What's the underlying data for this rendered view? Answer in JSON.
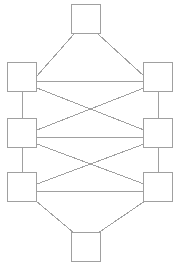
{
  "diagram": {
    "type": "node-link-diagram",
    "canvas": {
      "width": 181,
      "height": 269,
      "background": "#ffffff"
    },
    "style": {
      "node_shape": "square",
      "node_fill": "#ffffff",
      "node_stroke": "#a0a0a0",
      "node_stroke_width": 1,
      "node_size": 29,
      "edge_stroke": "#a0a0a0",
      "edge_stroke_width": 1
    },
    "nodes": [
      {
        "id": "top",
        "label": "",
        "x": 86,
        "y": 19,
        "w": 29,
        "h": 29,
        "row": 0,
        "column": "center"
      },
      {
        "id": "row1-left",
        "label": "",
        "x": 22,
        "y": 77,
        "w": 29,
        "h": 29,
        "row": 1,
        "column": "left"
      },
      {
        "id": "row1-right",
        "label": "",
        "x": 158,
        "y": 77,
        "w": 29,
        "h": 29,
        "row": 1,
        "column": "right"
      },
      {
        "id": "row2-left",
        "label": "",
        "x": 22,
        "y": 133,
        "w": 29,
        "h": 29,
        "row": 2,
        "column": "left"
      },
      {
        "id": "row2-right",
        "label": "",
        "x": 158,
        "y": 133,
        "w": 29,
        "h": 29,
        "row": 2,
        "column": "right"
      },
      {
        "id": "row3-left",
        "label": "",
        "x": 22,
        "y": 187,
        "w": 29,
        "h": 29,
        "row": 3,
        "column": "left"
      },
      {
        "id": "row3-right",
        "label": "",
        "x": 158,
        "y": 187,
        "w": 29,
        "h": 29,
        "row": 3,
        "column": "right"
      },
      {
        "id": "bottom",
        "label": "",
        "x": 86,
        "y": 247,
        "w": 29,
        "h": 29,
        "row": 4,
        "column": "center"
      }
    ],
    "edges": [
      {
        "id": "e-top-r1l",
        "from": "top",
        "to": "row1-left",
        "kind": "diagonal",
        "x1": 74,
        "y1": 34,
        "x2": 36,
        "y2": 77
      },
      {
        "id": "e-top-r1r",
        "from": "top",
        "to": "row1-right",
        "kind": "diagonal",
        "x1": 98,
        "y1": 34,
        "x2": 145,
        "y2": 77
      },
      {
        "id": "e-r1-rung",
        "from": "row1-left",
        "to": "row1-right",
        "kind": "horizontal",
        "x1": 37,
        "y1": 81,
        "x2": 144,
        "y2": 81
      },
      {
        "id": "e-r2-rung",
        "from": "row2-left",
        "to": "row2-right",
        "kind": "horizontal",
        "x1": 37,
        "y1": 137,
        "x2": 144,
        "y2": 137
      },
      {
        "id": "e-r3-rung",
        "from": "row3-left",
        "to": "row3-right",
        "kind": "horizontal",
        "x1": 37,
        "y1": 191,
        "x2": 144,
        "y2": 191
      },
      {
        "id": "e-left-1-2",
        "from": "row1-left",
        "to": "row2-left",
        "kind": "vertical",
        "x1": 22,
        "y1": 92,
        "x2": 22,
        "y2": 118
      },
      {
        "id": "e-left-2-3",
        "from": "row2-left",
        "to": "row3-left",
        "kind": "vertical",
        "x1": 22,
        "y1": 148,
        "x2": 22,
        "y2": 172
      },
      {
        "id": "e-right-1-2",
        "from": "row1-right",
        "to": "row2-right",
        "kind": "vertical",
        "x1": 158,
        "y1": 92,
        "x2": 158,
        "y2": 118
      },
      {
        "id": "e-right-2-3",
        "from": "row2-right",
        "to": "row3-right",
        "kind": "vertical",
        "x1": 158,
        "y1": 148,
        "x2": 158,
        "y2": 172
      },
      {
        "id": "e-x1-a",
        "from": "row1-left",
        "to": "row2-right",
        "kind": "cross",
        "x1": 37,
        "y1": 88,
        "x2": 144,
        "y2": 130
      },
      {
        "id": "e-x1-b",
        "from": "row1-right",
        "to": "row2-left",
        "kind": "cross",
        "x1": 144,
        "y1": 88,
        "x2": 37,
        "y2": 130
      },
      {
        "id": "e-x2-a",
        "from": "row2-left",
        "to": "row3-right",
        "kind": "cross",
        "x1": 37,
        "y1": 144,
        "x2": 144,
        "y2": 184
      },
      {
        "id": "e-x2-b",
        "from": "row2-right",
        "to": "row3-left",
        "kind": "cross",
        "x1": 144,
        "y1": 144,
        "x2": 37,
        "y2": 184
      },
      {
        "id": "e-r3l-bot",
        "from": "row3-left",
        "to": "bottom",
        "kind": "diagonal",
        "x1": 36,
        "y1": 201,
        "x2": 74,
        "y2": 233
      },
      {
        "id": "e-r3r-bot",
        "from": "row3-right",
        "to": "bottom",
        "kind": "diagonal",
        "x1": 145,
        "y1": 201,
        "x2": 98,
        "y2": 233
      }
    ],
    "counts": {
      "nodes": 8,
      "edges": 16
    }
  }
}
